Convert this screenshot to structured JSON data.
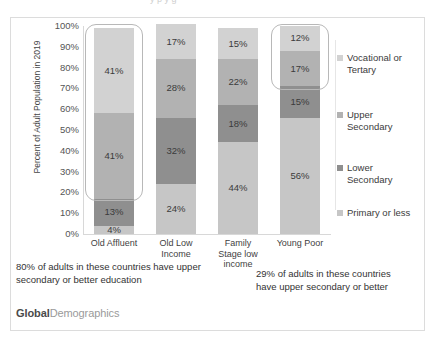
{
  "top_clip_text": "y p y g",
  "chart_data": {
    "type": "bar",
    "subtype": "stacked-100-percent",
    "title": "",
    "xlabel": "",
    "ylabel": "Percent of Adult Population in 2019",
    "ylim": [
      0,
      100
    ],
    "ytick_labels": [
      "100%",
      "90%",
      "80%",
      "70%",
      "60%",
      "50%",
      "40%",
      "30%",
      "20%",
      "10%",
      "0%"
    ],
    "ytick_values": [
      100,
      90,
      80,
      70,
      60,
      50,
      40,
      30,
      20,
      10,
      0
    ],
    "grid": false,
    "legend_position": "right",
    "categories": [
      "Old Affluent",
      "Old Low Income",
      "Family Stage low income",
      "Young Poor"
    ],
    "category_labels_wrapped": [
      [
        "Old Affluent"
      ],
      [
        "Old Low",
        "Income"
      ],
      [
        "Family",
        "Stage low",
        "income"
      ],
      [
        "Young Poor"
      ]
    ],
    "series": [
      {
        "name": "Vocational or Tertary",
        "color": "#d2d2d2",
        "values": [
          41,
          17,
          15,
          12
        ],
        "labels": [
          "41%",
          "17%",
          "15%",
          "12%"
        ]
      },
      {
        "name": "Upper Secondary",
        "color": "#b2b2b2",
        "values": [
          41,
          28,
          22,
          17
        ],
        "labels": [
          "41%",
          "28%",
          "22%",
          "17%"
        ]
      },
      {
        "name": "Lower Secondary",
        "color": "#8f8f8f",
        "values": [
          13,
          32,
          18,
          15
        ],
        "labels": [
          "13%",
          "32%",
          "18%",
          "15%"
        ]
      },
      {
        "name": "Primary or less",
        "color": "#c6c6c6",
        "values": [
          4,
          24,
          44,
          56
        ],
        "labels": [
          "4%",
          "24%",
          "44%",
          "56%"
        ]
      }
    ],
    "callouts": [
      {
        "category": "Old Affluent",
        "from_percent": 18,
        "to_percent": 100
      },
      {
        "category": "Young Poor",
        "from_percent": 71,
        "to_percent": 100
      }
    ],
    "annotations": [
      "80% of adults in these countries have upper secondary or better education",
      "29% of adults in these countries have upper secondary or better"
    ]
  },
  "legend": {
    "items": [
      {
        "label_line1": "Vocational or",
        "label_line2": "Tertary",
        "color": "#d2d2d2"
      },
      {
        "label_line1": "Upper",
        "label_line2": "Secondary",
        "color": "#b2b2b2"
      },
      {
        "label_line1": "Lower",
        "label_line2": "Secondary",
        "color": "#8f8f8f"
      },
      {
        "label_line1": "Primary or less",
        "label_line2": "",
        "color": "#c6c6c6"
      }
    ]
  },
  "annotations": {
    "left": "80% of adults in these countries have upper secondary or better education",
    "right": "29% of adults in these countries have upper secondary or better"
  },
  "watermark": {
    "bold_part": "Global",
    "light_part": "Demographics"
  }
}
